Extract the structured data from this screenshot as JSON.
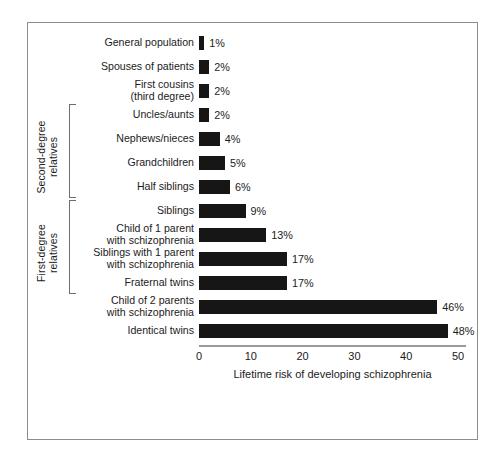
{
  "chart_data": {
    "type": "bar",
    "orientation": "horizontal",
    "title": "",
    "xlabel": "Lifetime risk of developing schizophrenia",
    "ylabel": "",
    "xlim": [
      0,
      53
    ],
    "xticks": [
      0,
      10,
      20,
      30,
      40,
      50
    ],
    "xtick_labels": [
      "0",
      "10",
      "20",
      "30",
      "40",
      "50"
    ],
    "grid": false,
    "legend": "none",
    "bar_color": "#161616",
    "axis_color": "#9a9a9a",
    "frame_color": "#8c8c8c",
    "categories": [
      "General population",
      "Spouses of patients",
      "First cousins\n(third degree)",
      "Uncles/aunts",
      "Nephews/nieces",
      "Grandchildren",
      "Half siblings",
      "Siblings",
      "Child of 1 parent\nwith schizophrenia",
      "Siblings with 1 parent\nwith schizophrenia",
      "Fraternal twins",
      "Child of 2 parents\nwith schizophrenia",
      "Identical twins"
    ],
    "values": [
      1,
      2,
      2,
      2,
      4,
      5,
      6,
      9,
      13,
      17,
      17,
      46,
      48
    ],
    "value_labels": [
      "1%",
      "2%",
      "2%",
      "2%",
      "4%",
      "5%",
      "6%",
      "9%",
      "13%",
      "17%",
      "17%",
      "46%",
      "48%"
    ],
    "groups": [
      {
        "label": "Second-degree\nrelatives",
        "first_index": 3,
        "last_index": 6
      },
      {
        "label": "First-degree\nrelatives",
        "first_index": 7,
        "last_index": 10
      }
    ]
  }
}
